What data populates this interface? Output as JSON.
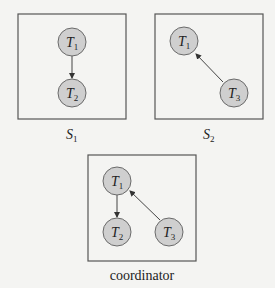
{
  "diagram": {
    "sites": [
      {
        "id": "S1",
        "caption": {
          "base": "S",
          "sub": "1"
        },
        "nodes": [
          {
            "id": "T1",
            "base": "T",
            "sub": "1"
          },
          {
            "id": "T2",
            "base": "T",
            "sub": "2"
          }
        ],
        "edges": [
          {
            "from": "T1",
            "to": "T2"
          }
        ]
      },
      {
        "id": "S2",
        "caption": {
          "base": "S",
          "sub": "2"
        },
        "nodes": [
          {
            "id": "T1",
            "base": "T",
            "sub": "1"
          },
          {
            "id": "T3",
            "base": "T",
            "sub": "3"
          }
        ],
        "edges": [
          {
            "from": "T3",
            "to": "T1"
          }
        ]
      }
    ],
    "coordinator": {
      "caption": "coordinator",
      "nodes": [
        {
          "id": "T1",
          "base": "T",
          "sub": "1"
        },
        {
          "id": "T2",
          "base": "T",
          "sub": "2"
        },
        {
          "id": "T3",
          "base": "T",
          "sub": "3"
        }
      ],
      "edges": [
        {
          "from": "T1",
          "to": "T2"
        },
        {
          "from": "T3",
          "to": "T1"
        }
      ]
    },
    "colors": {
      "node_fill": "#cfcfcf",
      "node_stroke": "#6a6a6a",
      "box_stroke": "#555555",
      "background": "#f4f4f2"
    }
  }
}
